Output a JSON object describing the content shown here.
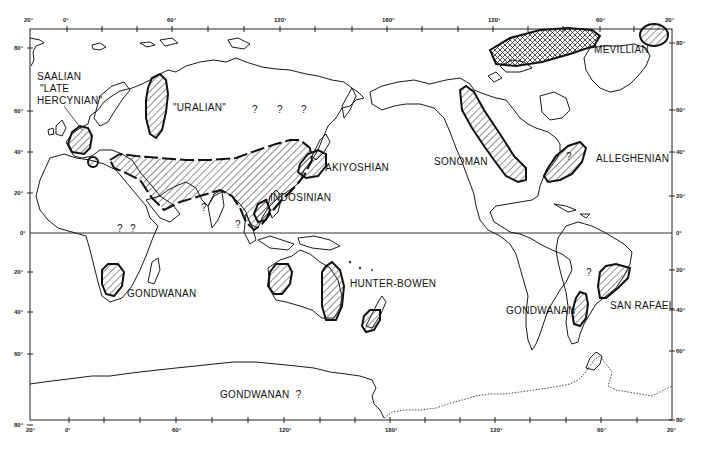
{
  "map": {
    "subject": "Permo-Triassic orogenic belts",
    "top_axis_labels": [
      {
        "text": "20°",
        "x": 30
      },
      {
        "text": "0°",
        "x": 67
      },
      {
        "text": "60°",
        "x": 172
      },
      {
        "text": "120°",
        "x": 280
      },
      {
        "text": "180°",
        "x": 388
      },
      {
        "text": "120°",
        "x": 493
      },
      {
        "text": "60°",
        "x": 600
      },
      {
        "text": "20°",
        "x": 670
      }
    ],
    "bottom_axis_labels": [
      {
        "text": "20°",
        "x": 30
      },
      {
        "text": "0°",
        "x": 67
      },
      {
        "text": "60°",
        "x": 177
      },
      {
        "text": "120°",
        "x": 284
      },
      {
        "text": "180°",
        "x": 390
      },
      {
        "text": "120°",
        "x": 495
      },
      {
        "text": "60°",
        "x": 601
      },
      {
        "text": "20°",
        "x": 672
      }
    ],
    "left_axis_labels": [
      {
        "text": "80°",
        "y": 48
      },
      {
        "text": "60°",
        "y": 111
      },
      {
        "text": "40°",
        "y": 152
      },
      {
        "text": "20°",
        "y": 193
      },
      {
        "text": "0°",
        "y": 233
      },
      {
        "text": "20°",
        "y": 272
      },
      {
        "text": "40°",
        "y": 312
      },
      {
        "text": "60°",
        "y": 354
      },
      {
        "text": "80°",
        "y": 425
      }
    ],
    "right_axis_labels": [
      {
        "text": "80°",
        "y": 43
      },
      {
        "text": "60°",
        "y": 110
      },
      {
        "text": "40°",
        "y": 152
      },
      {
        "text": "20°",
        "y": 196
      },
      {
        "text": "0°",
        "y": 233
      },
      {
        "text": "20°",
        "y": 270
      },
      {
        "text": "40°",
        "y": 310
      },
      {
        "text": "60°",
        "y": 351
      },
      {
        "text": "80°",
        "y": 420
      }
    ],
    "belts": [
      {
        "name": "SAALIAN \"LATE HERCYNIAN\"",
        "lines": [
          "SAALIAN",
          "\"LATE",
          "HERCYNIAN\""
        ]
      },
      {
        "name": "\"URALIAN\"",
        "lines": [
          "\"URALIAN\""
        ]
      },
      {
        "name": "AKIYOSHIAN",
        "lines": [
          "AKIYOSHIAN"
        ]
      },
      {
        "name": "INDOSINIAN",
        "lines": [
          "INDOSINIAN"
        ]
      },
      {
        "name": "GONDWANAN (Africa)",
        "lines": [
          "GONDWANAN"
        ]
      },
      {
        "name": "HUNTER-BOWEN",
        "lines": [
          "HUNTER-BOWEN"
        ]
      },
      {
        "name": "SONOMAN",
        "lines": [
          "SONOMAN"
        ]
      },
      {
        "name": "MEVILLIAN",
        "lines": [
          "MEVILLIAN"
        ]
      },
      {
        "name": "ALLEGHENIAN",
        "lines": [
          "ALLEGHENIAN"
        ]
      },
      {
        "name": "GONDWANAN (South America)",
        "lines": [
          "GONDWANAN"
        ]
      },
      {
        "name": "SAN RAFAEL",
        "lines": [
          "SAN RAFAEL"
        ]
      },
      {
        "name": "GONDWANAN ? (Antarctica)",
        "lines": [
          "GONDWANAN  ?"
        ]
      }
    ],
    "question_marks": [
      "?",
      "?",
      "?",
      "?",
      "?",
      "?",
      "?",
      "?",
      "?"
    ]
  }
}
